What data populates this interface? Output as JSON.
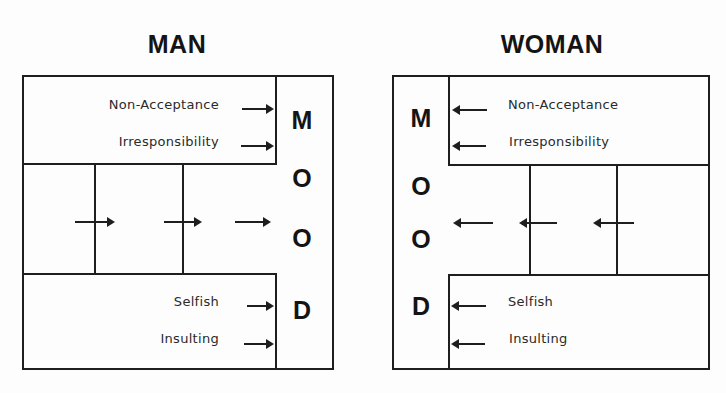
{
  "panels": {
    "man": {
      "title": "MAN",
      "mood_letters": [
        "M",
        "O",
        "O",
        "D"
      ],
      "top_labels": [
        "Non-Acceptance",
        "Irresponsibility"
      ],
      "bottom_labels": [
        "Selfish",
        "Insulting"
      ],
      "arrow_direction": "right"
    },
    "woman": {
      "title": "WOMAN",
      "mood_letters": [
        "M",
        "O",
        "O",
        "D"
      ],
      "top_labels": [
        "Non-Acceptance",
        "Irresponsibility"
      ],
      "bottom_labels": [
        "Selfish",
        "Insulting"
      ],
      "arrow_direction": "left"
    }
  },
  "colors": {
    "line": "#1e1e1e",
    "text": "#141414",
    "background": "#fdfdfd"
  }
}
